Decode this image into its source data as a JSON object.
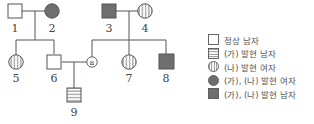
{
  "individuals": [
    {
      "id": "1",
      "label": "1",
      "sex": "male",
      "phenotype": "정상"
    },
    {
      "id": "2",
      "label": "2",
      "sex": "female",
      "phenotype": "(가), (나) 발현"
    },
    {
      "id": "3",
      "label": "3",
      "sex": "male",
      "phenotype": "(가), (나) 발현"
    },
    {
      "id": "4",
      "label": "4",
      "sex": "female",
      "phenotype": "(나) 발현"
    },
    {
      "id": "5",
      "label": "5",
      "sex": "female",
      "phenotype": "(나) 발현"
    },
    {
      "id": "6",
      "label": "6",
      "sex": "male",
      "phenotype": "정상"
    },
    {
      "id": "a",
      "label": "ⓐ",
      "sex": "female",
      "phenotype": "unknown"
    },
    {
      "id": "7",
      "label": "7",
      "sex": "female",
      "phenotype": "(나) 발현"
    },
    {
      "id": "8",
      "label": "8",
      "sex": "male",
      "phenotype": "(가), (나) 발현"
    },
    {
      "id": "9",
      "label": "9",
      "sex": "male",
      "phenotype": "(가) 발현"
    }
  ],
  "labels": {
    "p1": "1",
    "p2": "2",
    "p3": "3",
    "p4": "4",
    "p5": "5",
    "p6": "6",
    "pa": "a",
    "p7": "7",
    "p8": "8",
    "p9": "9"
  },
  "legend": {
    "items": [
      {
        "symbol": "empty-square",
        "label": "정상 남자"
      },
      {
        "symbol": "horizontal-striped-square",
        "label": "(가) 발현 남자"
      },
      {
        "symbol": "vertical-striped-circle",
        "label": "(나) 발현 여자"
      },
      {
        "symbol": "filled-circle",
        "label": "(가), (나) 발현 여자"
      },
      {
        "symbol": "filled-square",
        "label": "(가), (나) 발현 남자"
      }
    ]
  },
  "colors": {
    "line": "#555555",
    "filled": "#6e6e6e"
  }
}
